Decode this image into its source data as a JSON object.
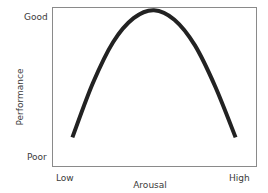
{
  "chart_data": {
    "type": "line",
    "title": "",
    "xlabel": "Arousal",
    "ylabel": "Performance",
    "x_tick_labels": [
      "Low",
      "High"
    ],
    "y_tick_labels": [
      "Poor",
      "Good"
    ],
    "grid": false,
    "legend": null,
    "shape": "inverted-U",
    "x": [
      0.1,
      0.2,
      0.3,
      0.4,
      0.5,
      0.6,
      0.7,
      0.8,
      0.9
    ],
    "series": [
      {
        "name": "Performance",
        "values": [
          0.18,
          0.52,
          0.78,
          0.93,
          0.98,
          0.92,
          0.76,
          0.5,
          0.18
        ]
      }
    ],
    "xlim": [
      0,
      1
    ],
    "ylim": [
      0,
      1
    ],
    "line_color": "#222222"
  },
  "axes": {
    "y_top": "Good",
    "y_bottom": "Poor",
    "x_left": "Low",
    "x_right": "High",
    "x_title": "Arousal",
    "y_title": "Performance"
  }
}
